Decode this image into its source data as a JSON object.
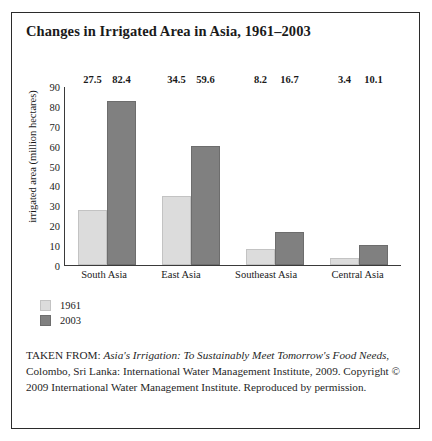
{
  "figure": {
    "title": "Changes in Irrigated Area in Asia, 1961–2003",
    "source_prefix": "TAKEN FROM: ",
    "source_title_italic": "Asia's Irrigation: To Sustainably Meet Tomorrow's Food Needs",
    "source_rest": ", Colombo, Sri Lanka: International Water Management Institute, 2009. Copyright © 2009 International Water Management Institute. Reproduced by permission."
  },
  "colors": {
    "series_1961": "#dcdcdc",
    "series_2003": "#808080",
    "frame": "#2b2b2b",
    "axis": "#3a3a3a",
    "background": "#ffffff"
  },
  "chart_data": {
    "type": "bar",
    "title": "Changes in Irrigated Area in Asia, 1961–2003",
    "xlabel": "",
    "ylabel": "irrigated area (million hectares)",
    "ylim": [
      0,
      90
    ],
    "yticks": [
      90,
      80,
      70,
      60,
      50,
      40,
      30,
      20,
      10,
      0
    ],
    "grid": false,
    "legend_position": "below-left",
    "categories": [
      "South Asia",
      "East Asia",
      "Southeast Asia",
      "Central Asia"
    ],
    "series": [
      {
        "name": "1961",
        "values": [
          27.5,
          34.5,
          8.2,
          3.4
        ]
      },
      {
        "name": "2003",
        "values": [
          82.4,
          59.6,
          16.7,
          10.1
        ]
      }
    ]
  }
}
